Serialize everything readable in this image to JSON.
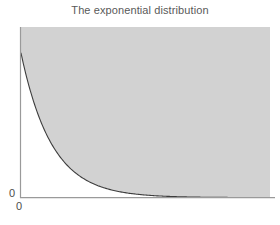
{
  "figure": {
    "title": "The exponential distribution",
    "title_color": "#595959",
    "background_color": "#ffffff"
  },
  "axes": {
    "y_axis": {
      "ticks": [
        {
          "label": "0"
        }
      ],
      "line_color": "#9a9a9a"
    },
    "x_axis": {
      "ticks": [
        {
          "label": "0"
        }
      ],
      "line_color": "#9a9a9a"
    }
  },
  "chart_data": {
    "type": "area",
    "title": "The exponential distribution",
    "xlabel": "",
    "ylabel": "",
    "xlim": [
      0,
      10
    ],
    "ylim": [
      0,
      1.18
    ],
    "grid": false,
    "legend": null,
    "series": [
      {
        "name": "exponential density",
        "curve_color": "#3d3d3d",
        "fill_color": "#d2d2d2",
        "fill_region": "above-curve",
        "x": [
          0,
          0.25,
          0.5,
          0.75,
          1,
          1.25,
          1.5,
          1.75,
          2,
          2.5,
          3,
          3.5,
          4,
          4.5,
          5,
          5.5,
          6,
          7,
          8,
          9,
          10
        ],
        "y": [
          1.0,
          0.82,
          0.67,
          0.55,
          0.45,
          0.37,
          0.3,
          0.25,
          0.2,
          0.135,
          0.09,
          0.06,
          0.04,
          0.027,
          0.018,
          0.012,
          0.008,
          0.0035,
          0.0015,
          0.0007,
          0.0003
        ]
      }
    ],
    "annotations": []
  }
}
